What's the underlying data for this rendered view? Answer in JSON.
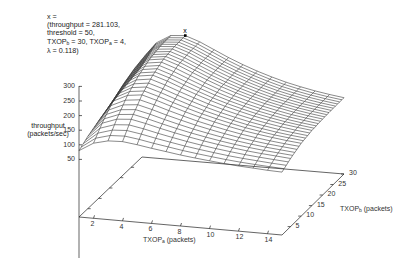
{
  "chart_data": {
    "type": "surface3d",
    "title": "",
    "xlabel": "TXOP_a (packets)",
    "ylabel": "TXOP_b (packets)",
    "zlabel": "throughput (packets/sec)",
    "x_ticks": [
      2,
      4,
      6,
      8,
      10,
      12,
      14
    ],
    "y_ticks": [
      5,
      10,
      15,
      20,
      25,
      30
    ],
    "z_ticks": [
      50,
      100,
      150,
      200,
      250,
      300
    ],
    "x_range": [
      1,
      15
    ],
    "y_range": [
      1,
      30
    ],
    "z_range": [
      0,
      300
    ],
    "grid": false,
    "legend": "none",
    "annotation": {
      "marker": "x",
      "throughput": 281.103,
      "threshold": 50,
      "TXOP_b": 30,
      "TXOP_a": 4,
      "lambda": 0.118
    },
    "x": [
      1,
      2,
      3,
      4,
      5,
      6,
      7,
      8,
      9,
      10,
      11,
      12,
      13,
      14,
      15
    ],
    "y_step_note": "rows correspond to TXOP_b = 1..30",
    "z_model": {
      "description": "approximate throughput surface; values listed by TXOP_b rows (b=1,5,10,15,20,25,30) across TXOP_a=1..15",
      "rows_b": [
        1,
        5,
        10,
        15,
        20,
        25,
        30
      ],
      "values": [
        [
          80,
          110,
          122,
          124,
          118,
          110,
          103,
          96,
          90,
          85,
          80,
          76,
          73,
          70,
          68
        ],
        [
          100,
          150,
          168,
          172,
          162,
          150,
          139,
          129,
          120,
          112,
          105,
          99,
          94,
          90,
          86
        ],
        [
          118,
          190,
          214,
          220,
          206,
          190,
          175,
          161,
          149,
          138,
          128,
          120,
          113,
          107,
          102
        ],
        [
          132,
          215,
          245,
          252,
          236,
          217,
          199,
          182,
          167,
          154,
          142,
          132,
          123,
          116,
          110
        ],
        [
          145,
          232,
          265,
          272,
          255,
          234,
          213,
          194,
          177,
          162,
          149,
          138,
          128,
          120,
          113
        ],
        [
          155,
          242,
          275,
          279,
          262,
          240,
          218,
          198,
          180,
          164,
          150,
          139,
          129,
          121,
          114
        ],
        [
          165,
          248,
          277,
          281.103,
          264,
          241,
          218,
          198,
          180,
          164,
          150,
          139,
          129,
          121,
          114
        ]
      ]
    }
  },
  "labels": {
    "annot_line1": "x =",
    "annot_line2": "(throughput = 281.103,",
    "annot_line3": "threshold = 50,",
    "annot_line4_a": "TXOP",
    "annot_line4_a_sub": "b",
    "annot_line4_b": " = 30, TXOP",
    "annot_line4_b_sub": "a",
    "annot_line4_c": " = 4,",
    "annot_line5": "λ = 0.118)",
    "marker": "x",
    "z_title_1": "throughput",
    "z_title_2": "(packets/sec)",
    "x_title": "TXOP",
    "x_title_sub": "a",
    "x_title_rest": " (packets)",
    "y_title": "TXOP",
    "y_title_sub": "b",
    "y_title_rest": " (packets)",
    "z_ticks": [
      "300",
      "250",
      "200",
      "150",
      "100",
      "50"
    ],
    "x_ticks": [
      "2",
      "4",
      "6",
      "8",
      "10",
      "12",
      "14"
    ],
    "y_ticks": [
      "5",
      "10",
      "15",
      "20",
      "25",
      "30"
    ]
  },
  "colors": {
    "line": "#3a3a3a",
    "axis": "#222222",
    "background": "#ffffff"
  }
}
